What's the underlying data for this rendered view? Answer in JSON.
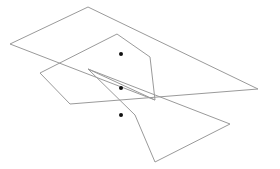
{
  "canvas": {
    "width": 280,
    "height": 169,
    "background": "#ffffff"
  },
  "style": {
    "stroke": "#9a9a9a",
    "stroke_width": 1,
    "dot_color": "#111111",
    "dot_radius": 2
  },
  "polylines": [
    {
      "name": "shape-a",
      "points": [
        [
          10,
          44
        ],
        [
          88,
          7
        ],
        [
          258,
          89
        ]
      ],
      "closed": false
    },
    {
      "name": "shape-a-lower-edge",
      "points": [
        [
          10,
          44
        ],
        [
          155,
          100
        ]
      ],
      "closed": false
    },
    {
      "name": "shape-b",
      "points": [
        [
          40,
          73
        ],
        [
          117,
          34
        ],
        [
          150,
          57
        ],
        [
          155,
          100
        ]
      ],
      "closed": false
    },
    {
      "name": "shape-b-base",
      "points": [
        [
          40,
          73
        ],
        [
          70,
          104
        ],
        [
          258,
          89
        ]
      ],
      "closed": false
    },
    {
      "name": "shape-c",
      "points": [
        [
          88,
          69
        ],
        [
          155,
          100
        ]
      ],
      "closed": false
    },
    {
      "name": "shape-c-bowtie",
      "points": [
        [
          88,
          69
        ],
        [
          135,
          115
        ],
        [
          155,
          162
        ],
        [
          230,
          124
        ],
        [
          88,
          69
        ]
      ],
      "closed": false
    }
  ],
  "dots": [
    {
      "name": "dot-top",
      "x": 121,
      "y": 54
    },
    {
      "name": "dot-middle",
      "x": 121,
      "y": 88
    },
    {
      "name": "dot-bottom",
      "x": 121,
      "y": 115
    }
  ]
}
